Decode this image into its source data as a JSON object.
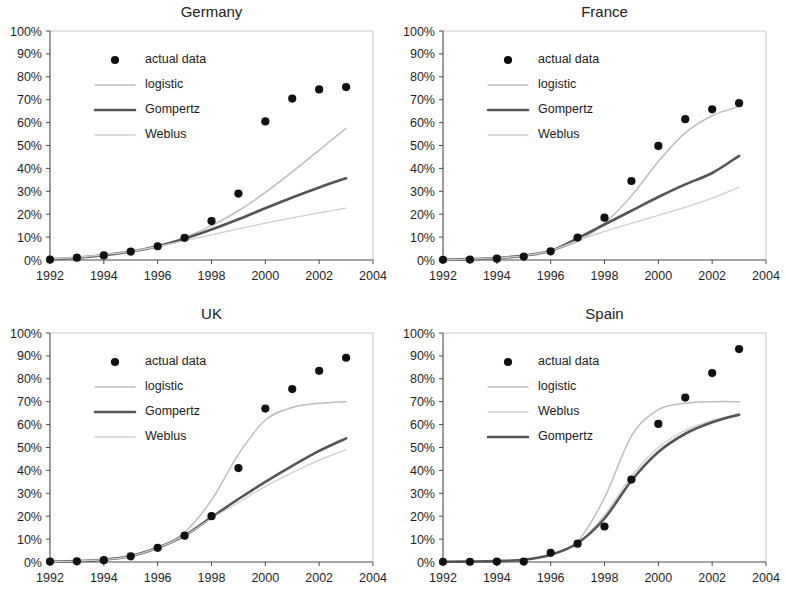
{
  "figure": {
    "panel_order": [
      "germany",
      "france",
      "uk",
      "spain"
    ],
    "background": "#ffffff"
  },
  "axes": {
    "y_ticks": [
      "0%",
      "10%",
      "20%",
      "30%",
      "40%",
      "50%",
      "60%",
      "70%",
      "80%",
      "90%",
      "100%"
    ],
    "x_ticks": [
      "1992",
      "1994",
      "1996",
      "1998",
      "2000",
      "2002",
      "2004"
    ],
    "ylim": [
      0,
      100
    ],
    "xlim": [
      1992,
      2004
    ]
  },
  "styles": {
    "marker_color": "#111111",
    "gompertz_color": "#555555",
    "logistic_color": "#bdbdbd",
    "weblus_color": "#cfcfcf",
    "axis_color": "#4a4a4a",
    "frame_color": "#c9c9c9",
    "text_color": "#1a1a1a"
  },
  "legend_labels": {
    "actual": "actual data",
    "logistic": "logistic",
    "gompertz": "Gompertz",
    "weblus": "Weblus"
  },
  "chart_data": [
    {
      "id": "germany",
      "type": "scatter",
      "title": "Germany",
      "xlabel": "",
      "ylabel": "",
      "xlim": [
        1992,
        2004
      ],
      "ylim": [
        0,
        100
      ],
      "grid": false,
      "legend_position": "upper-left",
      "legend_order": [
        "actual",
        "logistic",
        "gompertz",
        "weblus"
      ],
      "x": [
        1992,
        1993,
        1994,
        1995,
        1996,
        1997,
        1998,
        1999,
        2000,
        2001,
        2002,
        2003
      ],
      "actual_data": [
        0.2,
        1.0,
        2.0,
        3.7,
        6.0,
        9.7,
        17.0,
        29.0,
        60.5,
        70.5,
        74.5,
        75.5
      ],
      "series": [
        {
          "name": "logistic",
          "x": [
            1992,
            1993,
            1994,
            1995,
            1996,
            1997,
            1998,
            1999,
            2000,
            2001,
            2002,
            2003
          ],
          "values": [
            0.4,
            1.0,
            2.0,
            3.6,
            6.1,
            9.8,
            15.0,
            21.5,
            29.5,
            38.5,
            48.0,
            57.5
          ]
        },
        {
          "name": "Gompertz",
          "x": [
            1992,
            1993,
            1994,
            1995,
            1996,
            1997,
            1998,
            1999,
            2000,
            2001,
            2002,
            2003
          ],
          "values": [
            0.3,
            1.0,
            2.1,
            3.7,
            6.0,
            9.3,
            13.3,
            17.8,
            22.6,
            27.3,
            31.7,
            35.7
          ]
        },
        {
          "name": "Weblus",
          "x": [
            1992,
            1993,
            1994,
            1995,
            1996,
            1997,
            1998,
            1999,
            2000,
            2001,
            2002,
            2003
          ],
          "values": [
            0.4,
            1.2,
            2.3,
            3.8,
            5.9,
            8.4,
            11.0,
            13.6,
            16.1,
            18.4,
            20.6,
            22.7
          ]
        }
      ]
    },
    {
      "id": "france",
      "type": "scatter",
      "title": "France",
      "xlabel": "",
      "ylabel": "",
      "xlim": [
        1992,
        2004
      ],
      "ylim": [
        0,
        100
      ],
      "grid": false,
      "legend_position": "upper-left",
      "legend_order": [
        "actual",
        "logistic",
        "gompertz",
        "weblus"
      ],
      "x": [
        1992,
        1993,
        1994,
        1995,
        1996,
        1997,
        1998,
        1999,
        2000,
        2001,
        2002,
        2003
      ],
      "actual_data": [
        0.1,
        0.2,
        0.6,
        1.5,
        3.8,
        9.8,
        18.5,
        34.5,
        49.8,
        61.5,
        65.8,
        68.5
      ],
      "series": [
        {
          "name": "logistic",
          "x": [
            1992,
            1993,
            1994,
            1995,
            1996,
            1997,
            1998,
            1999,
            2000,
            2001,
            2002,
            2003
          ],
          "values": [
            0.2,
            0.4,
            0.9,
            1.9,
            4.0,
            8.2,
            16.0,
            28.0,
            43.0,
            55.5,
            63.0,
            67.0
          ]
        },
        {
          "name": "Gompertz",
          "x": [
            1992,
            1993,
            1994,
            1995,
            1996,
            1997,
            1998,
            1999,
            2000,
            2001,
            2002,
            2003
          ],
          "values": [
            0.2,
            0.4,
            0.9,
            1.9,
            4.0,
            9.5,
            15.5,
            21.5,
            27.5,
            33.0,
            38.0,
            45.5
          ]
        },
        {
          "name": "Weblus",
          "x": [
            1992,
            1993,
            1994,
            1995,
            1996,
            1997,
            1998,
            1999,
            2000,
            2001,
            2002,
            2003
          ],
          "values": [
            0.2,
            0.4,
            0.9,
            1.9,
            4.0,
            8.5,
            12.5,
            16.0,
            19.5,
            23.0,
            27.0,
            31.8
          ]
        }
      ]
    },
    {
      "id": "uk",
      "type": "scatter",
      "title": "UK",
      "xlabel": "",
      "ylabel": "",
      "xlim": [
        1992,
        2004
      ],
      "ylim": [
        0,
        100
      ],
      "grid": false,
      "legend_position": "upper-left",
      "legend_order": [
        "actual",
        "logistic",
        "gompertz",
        "weblus"
      ],
      "x": [
        1992,
        1993,
        1994,
        1995,
        1996,
        1997,
        1998,
        1999,
        2000,
        2001,
        2002,
        2003
      ],
      "actual_data": [
        0.2,
        0.3,
        0.8,
        2.5,
        6.2,
        11.5,
        20.0,
        41.0,
        67.0,
        75.5,
        83.5,
        89.2
      ],
      "series": [
        {
          "name": "logistic",
          "x": [
            1992,
            1993,
            1994,
            1995,
            1996,
            1997,
            1998,
            1999,
            2000,
            2001,
            2002,
            2003
          ],
          "values": [
            0.2,
            0.4,
            1.0,
            2.6,
            6.2,
            13.0,
            27.0,
            47.0,
            62.0,
            67.5,
            69.3,
            70.0
          ]
        },
        {
          "name": "Gompertz",
          "x": [
            1992,
            1993,
            1994,
            1995,
            1996,
            1997,
            1998,
            1999,
            2000,
            2001,
            2002,
            2003
          ],
          "values": [
            0.2,
            0.4,
            1.0,
            2.6,
            6.2,
            11.5,
            19.5,
            27.5,
            35.0,
            42.0,
            48.5,
            54.0
          ]
        },
        {
          "name": "Weblus",
          "x": [
            1992,
            1993,
            1994,
            1995,
            1996,
            1997,
            1998,
            1999,
            2000,
            2001,
            2002,
            2003
          ],
          "values": [
            0.2,
            0.4,
            1.0,
            2.6,
            6.2,
            11.5,
            19.0,
            26.0,
            33.0,
            39.0,
            44.5,
            49.0
          ]
        }
      ]
    },
    {
      "id": "spain",
      "type": "scatter",
      "title": "Spain",
      "xlabel": "",
      "ylabel": "",
      "xlim": [
        1992,
        2004
      ],
      "ylim": [
        0,
        100
      ],
      "grid": false,
      "legend_position": "upper-left",
      "legend_order": [
        "actual",
        "logistic",
        "weblus",
        "gompertz"
      ],
      "x": [
        1992,
        1993,
        1994,
        1995,
        1996,
        1997,
        1998,
        1999,
        2000,
        2001,
        2002,
        2003
      ],
      "actual_data": [
        0.1,
        0.1,
        0.2,
        0.2,
        4.0,
        8.0,
        15.5,
        36.0,
        60.3,
        71.8,
        82.5,
        93.0
      ],
      "series": [
        {
          "name": "logistic",
          "x": [
            1992,
            1993,
            1994,
            1995,
            1996,
            1997,
            1998,
            1999,
            2000,
            2001,
            2002,
            2003
          ],
          "values": [
            0.1,
            0.2,
            0.4,
            1.0,
            3.0,
            9.0,
            28.0,
            55.0,
            66.5,
            69.3,
            70.0,
            70.0
          ]
        },
        {
          "name": "Weblus",
          "x": [
            1992,
            1993,
            1994,
            1995,
            1996,
            1997,
            1998,
            1999,
            2000,
            2001,
            2002,
            2003
          ],
          "values": [
            0.1,
            0.2,
            0.4,
            1.0,
            3.2,
            8.5,
            20.5,
            37.5,
            50.0,
            57.5,
            61.8,
            64.8
          ]
        },
        {
          "name": "Gompertz",
          "x": [
            1992,
            1993,
            1994,
            1995,
            1996,
            1997,
            1998,
            1999,
            2000,
            2001,
            2002,
            2003
          ],
          "values": [
            0.1,
            0.2,
            0.4,
            1.0,
            3.2,
            8.2,
            19.0,
            35.5,
            48.0,
            56.0,
            61.0,
            64.3
          ]
        }
      ]
    }
  ]
}
